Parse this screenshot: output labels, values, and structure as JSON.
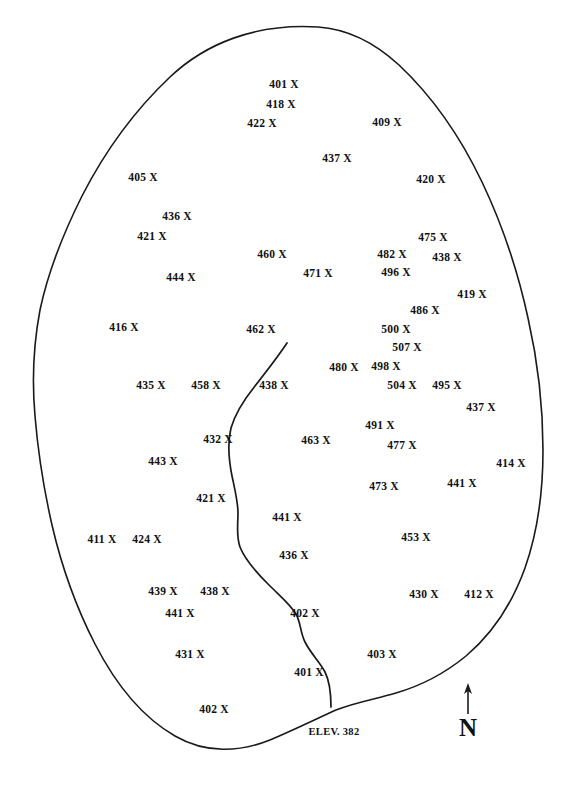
{
  "map": {
    "title": "Elevation Point Map",
    "outline_color": "#1a1a1a",
    "stream_color": "#1a1a1a",
    "label_color": "#111111",
    "background_color": "#ffffff",
    "marker_symbol": "X",
    "elevation_note": "ELEV. 382",
    "compass": {
      "letter": "N",
      "name": "north-arrow"
    },
    "points": [
      {
        "value": "401",
        "label": "401 X",
        "x": 284,
        "y": 85
      },
      {
        "value": "418",
        "label": "418 X",
        "x": 281,
        "y": 105
      },
      {
        "value": "422",
        "label": "422 X",
        "x": 262,
        "y": 124
      },
      {
        "value": "409",
        "label": "409 X",
        "x": 387,
        "y": 123
      },
      {
        "value": "437",
        "label": "437 X",
        "x": 337,
        "y": 159
      },
      {
        "value": "405",
        "label": "405 X",
        "x": 143,
        "y": 178
      },
      {
        "value": "420",
        "label": "420 X",
        "x": 431,
        "y": 180
      },
      {
        "value": "436",
        "label": "436 X",
        "x": 177,
        "y": 217
      },
      {
        "value": "421",
        "label": "421 X",
        "x": 152,
        "y": 237
      },
      {
        "value": "475",
        "label": "475 X",
        "x": 433,
        "y": 238
      },
      {
        "value": "460",
        "label": "460 X",
        "x": 272,
        "y": 255
      },
      {
        "value": "482",
        "label": "482 X",
        "x": 392,
        "y": 255
      },
      {
        "value": "438",
        "label": "438 X",
        "x": 447,
        "y": 258
      },
      {
        "value": "444",
        "label": "444 X",
        "x": 181,
        "y": 278
      },
      {
        "value": "471",
        "label": "471 X",
        "x": 318,
        "y": 274
      },
      {
        "value": "496",
        "label": "496 X",
        "x": 396,
        "y": 273
      },
      {
        "value": "419",
        "label": "419 X",
        "x": 472,
        "y": 295
      },
      {
        "value": "486",
        "label": "486 X",
        "x": 425,
        "y": 311
      },
      {
        "value": "416",
        "label": "416 X",
        "x": 124,
        "y": 328
      },
      {
        "value": "462",
        "label": "462 X",
        "x": 261,
        "y": 330
      },
      {
        "value": "500",
        "label": "500 X",
        "x": 396,
        "y": 330
      },
      {
        "value": "507",
        "label": "507 X",
        "x": 407,
        "y": 348
      },
      {
        "value": "480",
        "label": "480 X",
        "x": 344,
        "y": 368
      },
      {
        "value": "498",
        "label": "498 X",
        "x": 386,
        "y": 367
      },
      {
        "value": "435",
        "label": "435 X",
        "x": 151,
        "y": 386
      },
      {
        "value": "458",
        "label": "458 X",
        "x": 206,
        "y": 386
      },
      {
        "value": "438",
        "label": "438 X",
        "x": 274,
        "y": 386
      },
      {
        "value": "504",
        "label": "504 X",
        "x": 402,
        "y": 386
      },
      {
        "value": "495",
        "label": "495 X",
        "x": 447,
        "y": 386
      },
      {
        "value": "437",
        "label": "437 X",
        "x": 481,
        "y": 408
      },
      {
        "value": "491",
        "label": "491 X",
        "x": 380,
        "y": 426
      },
      {
        "value": "432",
        "label": "432 X",
        "x": 218,
        "y": 440
      },
      {
        "value": "463",
        "label": "463 X",
        "x": 316,
        "y": 441
      },
      {
        "value": "477",
        "label": "477 X",
        "x": 402,
        "y": 446
      },
      {
        "value": "443",
        "label": "443 X",
        "x": 163,
        "y": 462
      },
      {
        "value": "414",
        "label": "414 X",
        "x": 511,
        "y": 464
      },
      {
        "value": "473",
        "label": "473 X",
        "x": 384,
        "y": 487
      },
      {
        "value": "441",
        "label": "441 X",
        "x": 462,
        "y": 484
      },
      {
        "value": "421",
        "label": "421 X",
        "x": 211,
        "y": 499
      },
      {
        "value": "441",
        "label": "441 X",
        "x": 287,
        "y": 518
      },
      {
        "value": "411",
        "label": "411 X",
        "x": 102,
        "y": 540
      },
      {
        "value": "424",
        "label": "424 X",
        "x": 147,
        "y": 540
      },
      {
        "value": "453",
        "label": "453 X",
        "x": 416,
        "y": 538
      },
      {
        "value": "436",
        "label": "436 X",
        "x": 294,
        "y": 556
      },
      {
        "value": "439",
        "label": "439 X",
        "x": 163,
        "y": 592
      },
      {
        "value": "438",
        "label": "438 X",
        "x": 215,
        "y": 592
      },
      {
        "value": "430",
        "label": "430 X",
        "x": 424,
        "y": 595
      },
      {
        "value": "412",
        "label": "412 X",
        "x": 479,
        "y": 595
      },
      {
        "value": "441",
        "label": "441 X",
        "x": 180,
        "y": 614
      },
      {
        "value": "402",
        "label": "402 X",
        "x": 305,
        "y": 614
      },
      {
        "value": "431",
        "label": "431 X",
        "x": 190,
        "y": 655
      },
      {
        "value": "403",
        "label": "403 X",
        "x": 382,
        "y": 655
      },
      {
        "value": "401",
        "label": "401 X",
        "x": 309,
        "y": 673
      },
      {
        "value": "402",
        "label": "402 X",
        "x": 214,
        "y": 710
      }
    ],
    "elevation_marker": {
      "text": "ELEV. 382",
      "x": 334,
      "y": 732
    },
    "compass_position": {
      "letter_x": 468,
      "letter_y": 727,
      "arrow_x": 468,
      "arrow_top": 685,
      "arrow_bottom": 714
    }
  }
}
